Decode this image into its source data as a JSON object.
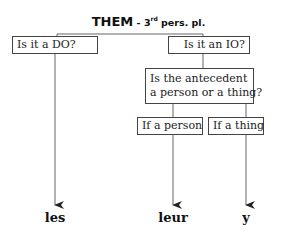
{
  "title": {
    "main": "THEM",
    "separator": " - ",
    "ordinal": "3",
    "ordinal_suffix": "rd",
    "rest": " pers. pl."
  },
  "nodes": {
    "do_question": "Is it a DO?",
    "io_question": "Is it an IO?",
    "antecedent_line1": "Is the antecedent",
    "antecedent_line2": "a person or a thing?",
    "if_person": "If a person",
    "if_thing": "If a thing"
  },
  "results": {
    "do_result": "les",
    "person_result": "leur",
    "thing_result": "y"
  },
  "colors": {
    "line": "#555555",
    "text": "#111111"
  }
}
